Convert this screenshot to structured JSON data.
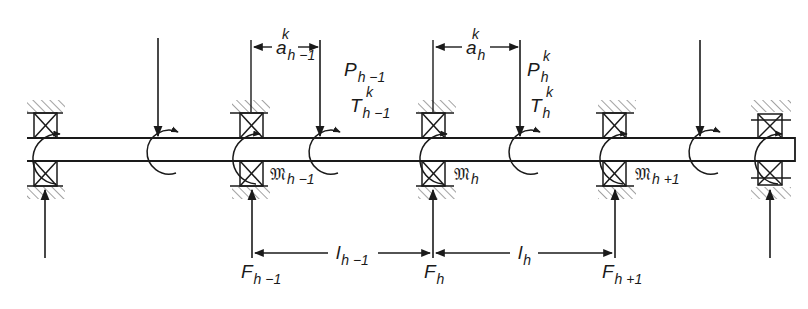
{
  "diagram": {
    "type": "continuous shaft on multiple bearings with point loads, torques, bearing reactions and moments",
    "colors": {
      "line": "#1a1a1a",
      "hatch": "#8a8a8a",
      "background": "#ffffff"
    },
    "bearings_x": [
      45,
      245,
      432,
      612,
      768
    ],
    "loads_x": [
      158,
      320,
      520,
      700
    ],
    "labels": {
      "a_prev": {
        "base": "a",
        "sub": "h −1",
        "sup": "k"
      },
      "a_cur": {
        "base": "a",
        "sub": "h",
        "sup": "k"
      },
      "P_prev": {
        "base": "P",
        "sub": "h −1"
      },
      "P_cur": {
        "base": "P",
        "sub": "h",
        "sup": "k"
      },
      "T_prev": {
        "base": "T",
        "sub": "h −1",
        "sup": "k"
      },
      "T_cur": {
        "base": "T",
        "sub": "h",
        "sup": "k"
      },
      "M_prev": {
        "base": "𝔐",
        "sub": "h −1"
      },
      "M_cur": {
        "base": "𝔐",
        "sub": "h"
      },
      "M_next": {
        "base": "𝔐",
        "sub": "h +1"
      },
      "l_prev": {
        "base": "l",
        "sub": "h −1"
      },
      "l_cur": {
        "base": "l",
        "sub": "h"
      },
      "F_prev": {
        "base": "F",
        "sub": "h −1"
      },
      "F_cur": {
        "base": "F",
        "sub": "h"
      },
      "F_next": {
        "base": "F",
        "sub": "h +1"
      }
    }
  }
}
